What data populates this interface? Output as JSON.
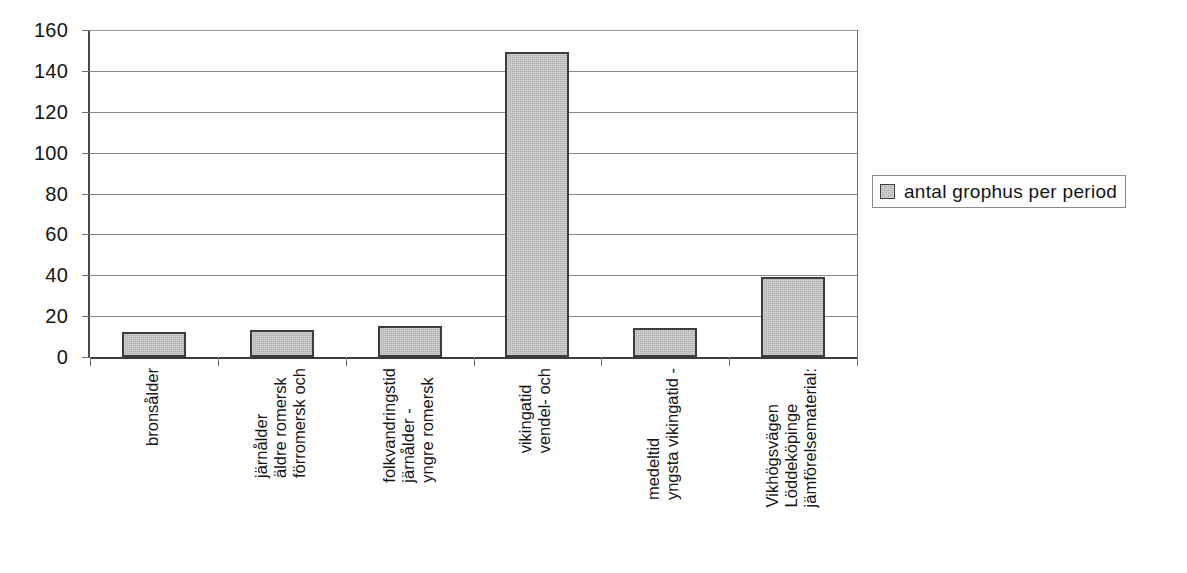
{
  "chart_data": {
    "type": "bar",
    "title": "",
    "xlabel": "",
    "ylabel": "",
    "ylim": [
      0,
      160
    ],
    "ytick_step": 20,
    "yticks": [
      160,
      140,
      120,
      100,
      80,
      60,
      40,
      20,
      0
    ],
    "grid": true,
    "legend_position": "right",
    "categories": [
      "bronsålder",
      "förromersk och äldre romersk järnålder",
      "yngre romersk järnålder - folkvandringstid",
      "vendel- och vikingatid",
      "yngsta vikingatid - medeltid",
      "jämförelsematerial: Löddeköpinge Vikhögsvägen"
    ],
    "category_lines": [
      [
        "bronsålder"
      ],
      [
        "förromersk och",
        "äldre romersk",
        "järnålder"
      ],
      [
        "yngre romersk",
        "järnålder -",
        "folkvandringstid"
      ],
      [
        "vendel- och",
        "vikingatid"
      ],
      [
        "yngsta vikingatid -",
        "medeltid"
      ],
      [
        "jämförelsematerial:",
        "Löddeköpinge",
        "Vikhögsvägen"
      ]
    ],
    "series": [
      {
        "name": "antal grophus per period",
        "values": [
          12,
          13,
          15,
          149,
          14,
          39
        ]
      }
    ],
    "colors": {
      "bar_fill": "#b3b3b3",
      "bar_border": "#3d3d3d",
      "gridline": "#878787",
      "axis": "#3c3c3c",
      "text": "#141414"
    }
  },
  "legend": {
    "entries": [
      {
        "label": "antal grophus per period",
        "swatch_icon": "square-swatch-icon"
      }
    ]
  }
}
